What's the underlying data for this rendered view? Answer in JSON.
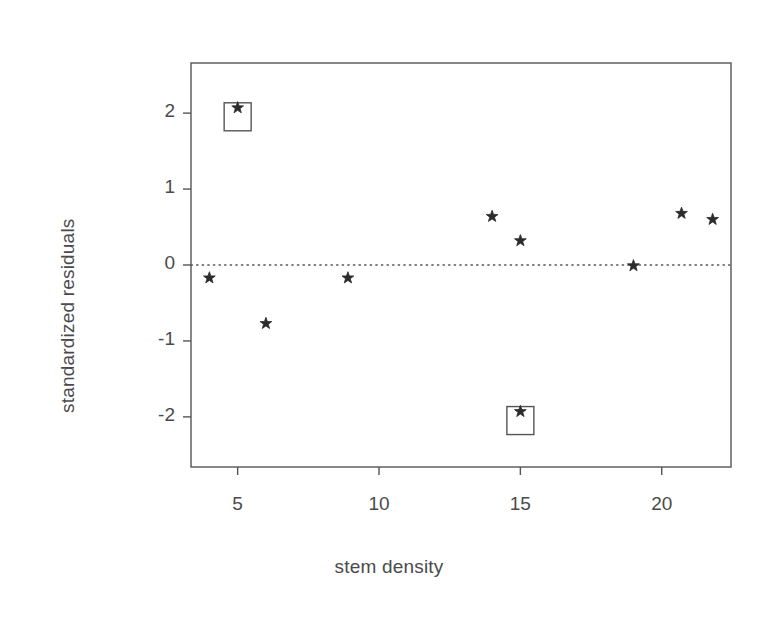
{
  "chart_data": {
    "type": "scatter",
    "title": "",
    "xlabel": "stem density",
    "ylabel": "standardized residuals",
    "xlim": [
      3.35,
      22.45
    ],
    "ylim": [
      -2.66,
      2.66
    ],
    "xticks": [
      5,
      10,
      15,
      20
    ],
    "xtick_labels": [
      "5",
      "10",
      "15",
      "20"
    ],
    "yticks": [
      2,
      1,
      0,
      -1,
      -2
    ],
    "ytick_labels": [
      "2",
      "1",
      "0",
      "-1",
      "-2"
    ],
    "grid": false,
    "legend": null,
    "marker": "star",
    "marker_color": "#2b2b2b",
    "frame_color": "#555555",
    "reference_line": {
      "y": 0,
      "style": "dotted",
      "color": "#555555"
    },
    "points": [
      {
        "x": 4.0,
        "y": -0.17,
        "highlighted": false
      },
      {
        "x": 5.0,
        "y": 2.07,
        "highlighted": true
      },
      {
        "x": 6.0,
        "y": -0.77,
        "highlighted": false
      },
      {
        "x": 8.9,
        "y": -0.17,
        "highlighted": false
      },
      {
        "x": 14.0,
        "y": 0.64,
        "highlighted": false
      },
      {
        "x": 15.0,
        "y": 0.32,
        "highlighted": false
      },
      {
        "x": 15.0,
        "y": -1.93,
        "highlighted": true
      },
      {
        "x": 19.0,
        "y": -0.01,
        "highlighted": false
      },
      {
        "x": 20.7,
        "y": 0.68,
        "highlighted": false
      },
      {
        "x": 21.8,
        "y": 0.6,
        "highlighted": false
      }
    ],
    "highlight_boxes": [
      {
        "x": 5.0,
        "y": 2.07,
        "label": ""
      },
      {
        "x": 15.0,
        "y": -1.93,
        "label": ""
      }
    ]
  },
  "colors": {
    "text": "#4a4a4a",
    "marker": "#2b2b2b",
    "frame": "#555555",
    "background": "#ffffff"
  }
}
